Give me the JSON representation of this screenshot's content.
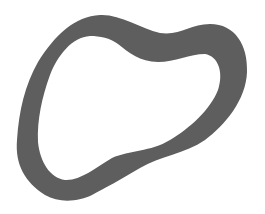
{
  "image": {
    "description": "Gray irregular closed ring shape on white background",
    "background_color": "#ffffff",
    "shape_color": "#5e5e5e"
  }
}
